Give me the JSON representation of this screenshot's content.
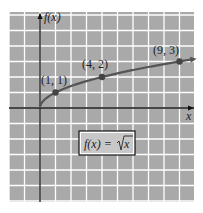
{
  "chart_data": {
    "type": "line",
    "title": "",
    "function_label": "f(x) = √x",
    "xlabel": "x",
    "ylabel": "f(x)",
    "series": [
      {
        "name": "f(x) = √x",
        "x": [
          0,
          1,
          4,
          9
        ],
        "values": [
          0,
          1,
          2,
          3
        ]
      }
    ],
    "points": [
      {
        "x": 1,
        "y": 1,
        "label": "(1, 1)"
      },
      {
        "x": 4,
        "y": 2,
        "label": "(4, 2)"
      },
      {
        "x": 9,
        "y": 3,
        "label": "(9, 3)"
      }
    ],
    "xlim": [
      -2,
      10
    ],
    "ylim": [
      -6,
      6
    ],
    "grid": true,
    "background": "#a9a9a9",
    "grid_color": "#ffffff",
    "curve_color": "#555555"
  },
  "labels": {
    "y_axis": "f(x)",
    "x_axis": "x",
    "p1": "(1, 1)",
    "p2": "(4, 2)",
    "p3": "(9, 3)",
    "formula_lhs": "f(x) = ",
    "formula_rad": "x"
  }
}
